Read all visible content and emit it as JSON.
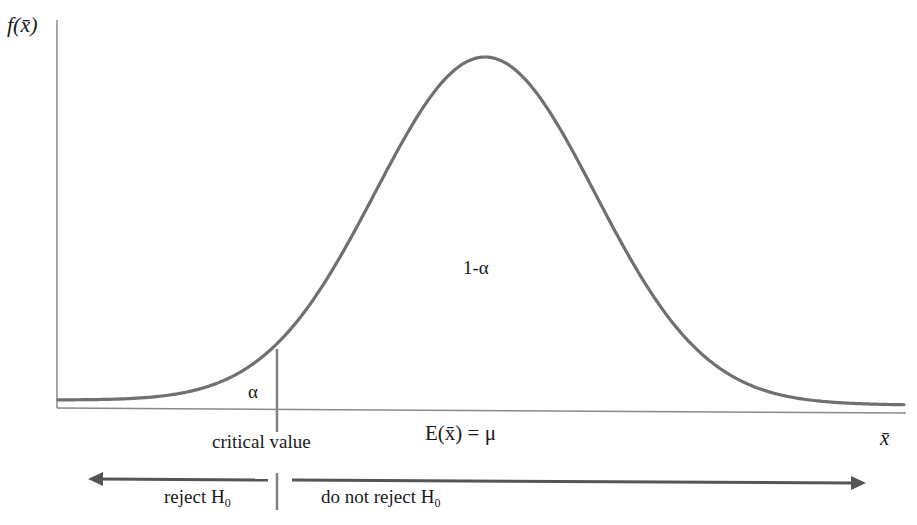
{
  "diagram": {
    "type": "normal-distribution-hypothesis-test",
    "y_axis_label": "f(x̄)",
    "x_axis_label": "x̄",
    "mean_label": "E(x̄) = μ",
    "center_area_label": "1-α",
    "tail_area_label": "α",
    "critical_value_label": "critical value",
    "reject_label": "reject H",
    "reject_sub": "0",
    "not_reject_label": "do not reject H",
    "not_reject_sub": "0",
    "colors": {
      "curve": "#707070",
      "axis": "#8a8a8a",
      "text": "#1a1a1a",
      "arrow": "#555555"
    }
  }
}
